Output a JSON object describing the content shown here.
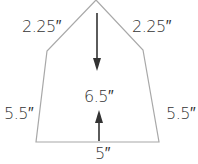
{
  "diagram": {
    "shape": "pentagon (house shape)",
    "labels": {
      "roof_left": "2.25″",
      "roof_right": "2.25″",
      "wall_left": "5.5″",
      "wall_right": "5.5″",
      "height": "6.5″",
      "base": "5″"
    },
    "colors": {
      "outline": "#a8a8a8",
      "arrow": "#333333",
      "text": "#333333"
    }
  }
}
